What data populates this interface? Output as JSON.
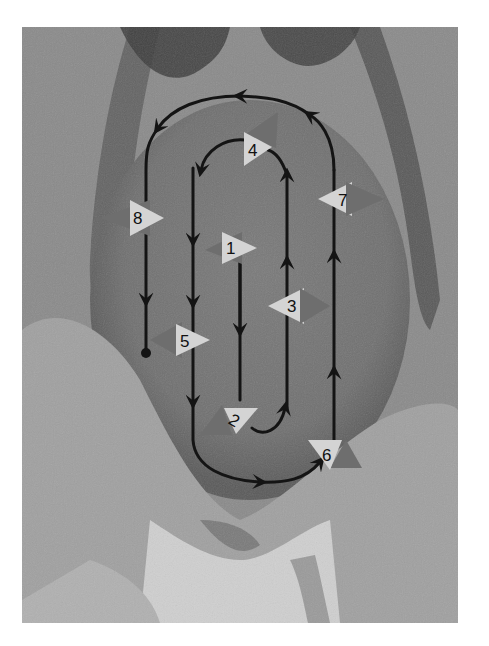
{
  "figure": {
    "background_colors": {
      "skin_mid": "#7d7d7d",
      "skin_dark": "#4a4a4a",
      "skin_light": "#bdbdbd",
      "path": "#141414",
      "marker_light": "#d4d4d4",
      "marker_dark": "#6e6e6e"
    },
    "path": {
      "start_marker": "dot",
      "end_marker": "none",
      "direction": "arrows along path"
    },
    "markers": [
      {
        "id": "1",
        "label": "1",
        "x": 233,
        "y": 248
      },
      {
        "id": "2",
        "label": "2",
        "x": 236,
        "y": 418
      },
      {
        "id": "3",
        "label": "3",
        "x": 294,
        "y": 306
      },
      {
        "id": "4",
        "label": "4",
        "x": 254,
        "y": 149
      },
      {
        "id": "5",
        "label": "5",
        "x": 186,
        "y": 342
      },
      {
        "id": "6",
        "label": "6",
        "x": 328,
        "y": 453
      },
      {
        "id": "7",
        "label": "7",
        "x": 346,
        "y": 199
      },
      {
        "id": "8",
        "label": "8",
        "x": 137,
        "y": 218
      }
    ]
  }
}
